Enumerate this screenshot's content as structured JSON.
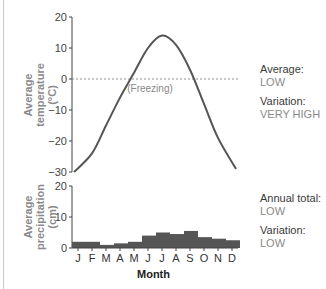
{
  "chart_data": [
    {
      "type": "line",
      "title": "",
      "ylabel": "Average temperature (°C)",
      "xlabel": "",
      "categories": [
        "J",
        "F",
        "M",
        "A",
        "M",
        "J",
        "J",
        "A",
        "S",
        "O",
        "N",
        "D"
      ],
      "values": [
        -30,
        -24,
        -15,
        -6,
        2,
        10,
        14,
        11,
        3,
        -8,
        -19,
        -29
      ],
      "ylim": [
        -30,
        20
      ],
      "yticks": [
        20,
        10,
        0,
        -10,
        -20,
        -30
      ],
      "reference_line": {
        "y": 0,
        "style": "dashed",
        "label": "(Freezing)"
      },
      "color": "#555555"
    },
    {
      "type": "bar",
      "title": "",
      "ylabel": "Average precipitation (cm)",
      "xlabel": "Month",
      "categories": [
        "J",
        "F",
        "M",
        "A",
        "M",
        "J",
        "J",
        "A",
        "S",
        "O",
        "N",
        "D"
      ],
      "values": [
        2,
        2,
        1,
        1.5,
        2,
        4,
        5,
        4.5,
        5.5,
        3.5,
        3,
        2.5
      ],
      "ylim": [
        0,
        20
      ],
      "yticks": [
        20,
        10,
        0
      ],
      "color": "#555555"
    }
  ],
  "temperature": {
    "ylabel_lines": [
      "Average",
      "temperature",
      "(°C)"
    ],
    "ticks": [
      "20",
      "10",
      "0",
      "−10",
      "−20",
      "−30"
    ],
    "freezing_label": "(Freezing)",
    "summary": {
      "average_label": "Average:",
      "average_value": "LOW",
      "variation_label": "Variation:",
      "variation_value": "VERY HIGH"
    }
  },
  "precipitation": {
    "ylabel_lines": [
      "Average",
      "precipitation",
      "(cm)"
    ],
    "ticks": [
      "20",
      "10",
      "0"
    ],
    "months": [
      "J",
      "F",
      "M",
      "A",
      "M",
      "J",
      "J",
      "A",
      "S",
      "O",
      "N",
      "D"
    ],
    "xlabel": "Month",
    "summary": {
      "total_label": "Annual total:",
      "total_value": "LOW",
      "variation_label": "Variation:",
      "variation_value": "LOW"
    }
  }
}
